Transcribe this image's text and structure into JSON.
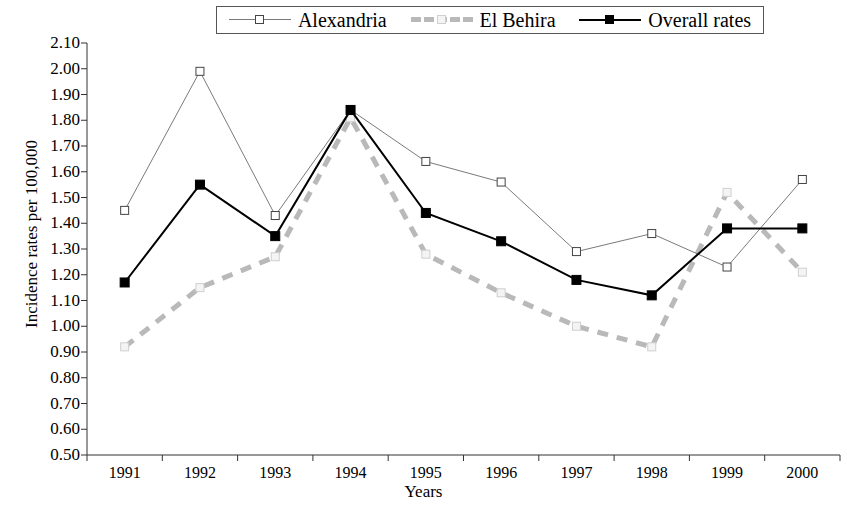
{
  "chart_data": {
    "type": "line",
    "title": "",
    "xlabel": "Years",
    "ylabel": "Incidence rates per 100,000",
    "categories": [
      "1991",
      "1992",
      "1993",
      "1994",
      "1995",
      "1996",
      "1997",
      "1998",
      "1999",
      "2000"
    ],
    "ylim": [
      0.5,
      2.1
    ],
    "ytick_step": 0.1,
    "yticks": [
      "2.10",
      "2.00",
      "1.90",
      "1.80",
      "1.70",
      "1.60",
      "1.50",
      "1.40",
      "1.30",
      "1.20",
      "1.10",
      "1.00",
      "0.90",
      "0.80",
      "0.70",
      "0.60",
      "0.50"
    ],
    "grid": false,
    "legend_position": "top",
    "series": [
      {
        "name": "Alexandria",
        "values": [
          1.45,
          1.99,
          1.43,
          1.84,
          1.64,
          1.56,
          1.29,
          1.36,
          1.23,
          1.57
        ],
        "color": "#7a7a7a",
        "marker": "open-square",
        "line_style": "solid",
        "line_width": 1
      },
      {
        "name": "El Behira",
        "values": [
          0.92,
          1.15,
          1.27,
          1.81,
          1.28,
          1.13,
          1.0,
          0.92,
          1.52,
          1.21
        ],
        "color": "#b9b9b9",
        "marker": "light-square",
        "line_style": "dashed",
        "line_width": 5
      },
      {
        "name": "Overall rates",
        "values": [
          1.17,
          1.55,
          1.35,
          1.84,
          1.44,
          1.33,
          1.18,
          1.12,
          1.38,
          1.38
        ],
        "color": "#000000",
        "marker": "filled-square",
        "line_style": "solid",
        "line_width": 2
      }
    ]
  },
  "legend": {
    "items": [
      {
        "label": "Alexandria"
      },
      {
        "label": "El Behira"
      },
      {
        "label": "Overall rates"
      }
    ]
  },
  "axes": {
    "y_title": "Incidence rates per 100,000",
    "x_title": "Years"
  }
}
